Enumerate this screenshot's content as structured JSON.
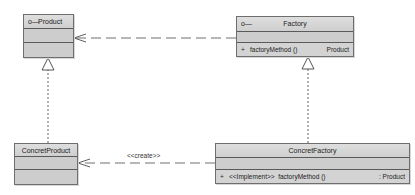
{
  "diagram": {
    "type": "UML class diagram",
    "classes": [
      {
        "id": "product",
        "name": "Product",
        "stereotype_icon": "interface-lollipop-icon",
        "icon_glyph": "o—",
        "attributes": [],
        "operations": []
      },
      {
        "id": "factory",
        "name": "Factory",
        "stereotype_icon": "interface-lollipop-icon",
        "icon_glyph": "o—",
        "attributes": [],
        "operations": [
          {
            "visibility": "+",
            "name": "factoryMethod ()",
            "return": "Product"
          }
        ]
      },
      {
        "id": "concret_product",
        "name": "ConcretProduct",
        "attributes": [],
        "operations": []
      },
      {
        "id": "concret_factory",
        "name": "ConcretFactory",
        "attributes": [],
        "operations": [
          {
            "visibility": "+",
            "name": "<<Implement>>  factoryMethod ()",
            "return": ": Product"
          }
        ]
      }
    ],
    "relationships": [
      {
        "from": "factory",
        "to": "product",
        "kind": "dependency",
        "label": ""
      },
      {
        "from": "concret_factory",
        "to": "concret_product",
        "kind": "dependency",
        "label": "<<create>>"
      },
      {
        "from": "concret_product",
        "to": "product",
        "kind": "realization",
        "label": ""
      },
      {
        "from": "concret_factory",
        "to": "factory",
        "kind": "realization",
        "label": ""
      }
    ],
    "colors": {
      "box_fill": "#cdcdcd",
      "header_fill": "#d8d8d8",
      "border": "#6e6e6e",
      "line": "#666666",
      "background": "#ffffff"
    }
  }
}
